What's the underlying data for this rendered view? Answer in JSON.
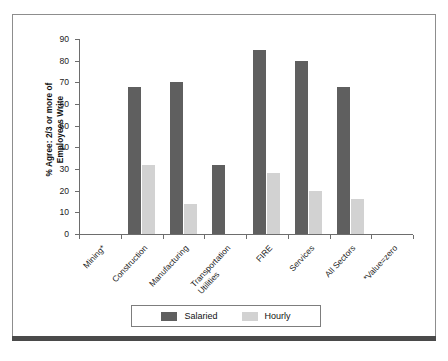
{
  "chart_data": {
    "type": "bar",
    "title": "",
    "subtitle": "",
    "xlabel": "",
    "ylabel": "% Agree: 2/3 or more of Employees Write",
    "ylabel_lines": [
      "% Agree: 2/3 or more of",
      "Employees Write"
    ],
    "ylim": [
      0,
      90
    ],
    "ytick_step": 10,
    "yticks": [
      90,
      80,
      70,
      60,
      50,
      40,
      30,
      20,
      10,
      0
    ],
    "grid": false,
    "legend_position": "bottom-center",
    "categories": [
      "Mining*",
      "Construction",
      "Manufacturing",
      "Transportation Utilities",
      "FIRE",
      "Services",
      "All Sectors",
      "*Value=zero"
    ],
    "category_labels": [
      {
        "line1": "Mining*",
        "line2": ""
      },
      {
        "line1": "Construction",
        "line2": ""
      },
      {
        "line1": "Manufacturing",
        "line2": ""
      },
      {
        "line1": "Transportation",
        "line2": "Utilities"
      },
      {
        "line1": "FIRE",
        "line2": ""
      },
      {
        "line1": "Services",
        "line2": ""
      },
      {
        "line1": "All Sectors",
        "line2": ""
      },
      {
        "line1": "*Value=zero",
        "line2": ""
      }
    ],
    "series": [
      {
        "name": "Salaried",
        "color": "#5f5f5f",
        "values": [
          0,
          68,
          70,
          32,
          85,
          80,
          68,
          0
        ]
      },
      {
        "name": "Hourly",
        "color": "#d2d2d2",
        "values": [
          0,
          32,
          14,
          0,
          28,
          20,
          16,
          0
        ]
      }
    ],
    "annotations": [
      "*Value=zero"
    ]
  },
  "legend": {
    "items": [
      {
        "label": "Salaried",
        "swatch": "salaried"
      },
      {
        "label": "Hourly",
        "swatch": "hourly"
      }
    ]
  },
  "colors": {
    "salaried": "#5f5f5f",
    "hourly": "#d2d2d2",
    "axis": "#6d6d6d",
    "frame": "#8d8d8d",
    "bottom_rule": "#4a4a4a",
    "text": "#1c1c1c",
    "background": "#ffffff"
  }
}
